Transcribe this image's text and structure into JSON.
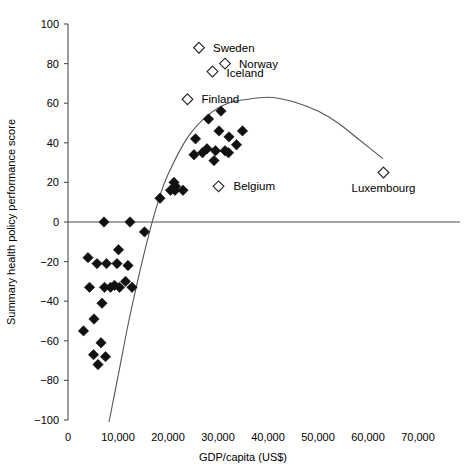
{
  "chart_data": {
    "type": "scatter",
    "title": "",
    "xlabel": "GDP/capita (US$)",
    "ylabel": "Summary health policy performance score",
    "xlim": [
      0,
      70000
    ],
    "ylim": [
      -100,
      100
    ],
    "xticks": [
      0,
      10000,
      20000,
      30000,
      40000,
      50000,
      60000,
      70000
    ],
    "xticklabels": [
      "0",
      "10,000",
      "20,000",
      "30,000",
      "40,000",
      "50,000",
      "60,000",
      "70,000"
    ],
    "yticks": [
      -100,
      -80,
      -60,
      -40,
      -20,
      0,
      20,
      40,
      60,
      80,
      100
    ],
    "yticklabels": [
      "-100",
      "-80",
      "-60",
      "-40",
      "-20",
      "0",
      "20",
      "40",
      "60",
      "80",
      "100"
    ],
    "grid": false,
    "legend": null,
    "zero_reference_line": 0,
    "marker_styles": {
      "unlabeled": "filled-diamond",
      "labeled": "open-diamond"
    },
    "labeled_points": [
      {
        "name": "Sweden",
        "x": 26200,
        "y": 88,
        "label_dx": 14,
        "label_dy": 4
      },
      {
        "name": "Norway",
        "x": 31400,
        "y": 80,
        "label_dx": 14,
        "label_dy": 4
      },
      {
        "name": "Iceland",
        "x": 28900,
        "y": 76,
        "label_dx": 14,
        "label_dy": 5
      },
      {
        "name": "Finland",
        "x": 23900,
        "y": 62,
        "label_dx": 14,
        "label_dy": 4
      },
      {
        "name": "Belgium",
        "x": 30100,
        "y": 18,
        "label_dx": 15,
        "label_dy": 4
      },
      {
        "name": "Luxembourg",
        "x": 63100,
        "y": 25,
        "label_dx": 0,
        "label_dy": 19
      }
    ],
    "unlabeled_points": [
      {
        "x": 12400,
        "y": 0
      },
      {
        "x": 15300,
        "y": -5
      },
      {
        "x": 18400,
        "y": 12
      },
      {
        "x": 20500,
        "y": 16
      },
      {
        "x": 21400,
        "y": 16
      },
      {
        "x": 21200,
        "y": 20
      },
      {
        "x": 21500,
        "y": 18
      },
      {
        "x": 23000,
        "y": 16
      },
      {
        "x": 25500,
        "y": 42
      },
      {
        "x": 25200,
        "y": 34
      },
      {
        "x": 28100,
        "y": 52
      },
      {
        "x": 30600,
        "y": 56
      },
      {
        "x": 30200,
        "y": 46
      },
      {
        "x": 29500,
        "y": 36
      },
      {
        "x": 29200,
        "y": 31
      },
      {
        "x": 32200,
        "y": 43
      },
      {
        "x": 32100,
        "y": 35
      },
      {
        "x": 31400,
        "y": 36
      },
      {
        "x": 33700,
        "y": 39
      },
      {
        "x": 34900,
        "y": 46
      },
      {
        "x": 26900,
        "y": 35
      },
      {
        "x": 27800,
        "y": 37
      },
      {
        "x": 7200,
        "y": 0
      },
      {
        "x": 10100,
        "y": -14
      },
      {
        "x": 4000,
        "y": -18
      },
      {
        "x": 5800,
        "y": -21
      },
      {
        "x": 7700,
        "y": -21
      },
      {
        "x": 9800,
        "y": -21
      },
      {
        "x": 12000,
        "y": -22
      },
      {
        "x": 11500,
        "y": -30
      },
      {
        "x": 12800,
        "y": -33
      },
      {
        "x": 9300,
        "y": -32
      },
      {
        "x": 4300,
        "y": -33
      },
      {
        "x": 7300,
        "y": -33
      },
      {
        "x": 8500,
        "y": -33
      },
      {
        "x": 10300,
        "y": -33
      },
      {
        "x": 6800,
        "y": -41
      },
      {
        "x": 5200,
        "y": -49
      },
      {
        "x": 3100,
        "y": -55
      },
      {
        "x": 6600,
        "y": -61
      },
      {
        "x": 5100,
        "y": -67
      },
      {
        "x": 7500,
        "y": -68
      },
      {
        "x": 6000,
        "y": -72
      }
    ],
    "fit_curve": {
      "description": "quadratic fit, peak near GDP 43,000 at score 62",
      "points": [
        {
          "x": 8200,
          "y": -101
        },
        {
          "x": 10000,
          "y": -78
        },
        {
          "x": 12000,
          "y": -52
        },
        {
          "x": 14000,
          "y": -29
        },
        {
          "x": 16000,
          "y": -8
        },
        {
          "x": 18000,
          "y": 10
        },
        {
          "x": 20000,
          "y": 24
        },
        {
          "x": 24000,
          "y": 43
        },
        {
          "x": 28000,
          "y": 54
        },
        {
          "x": 32000,
          "y": 60
        },
        {
          "x": 36000,
          "y": 62
        },
        {
          "x": 40000,
          "y": 63
        },
        {
          "x": 43000,
          "y": 62
        },
        {
          "x": 46000,
          "y": 60
        },
        {
          "x": 50000,
          "y": 56
        },
        {
          "x": 54000,
          "y": 50
        },
        {
          "x": 58000,
          "y": 42
        },
        {
          "x": 63000,
          "y": 32
        }
      ]
    }
  },
  "colors": {
    "marker_fill": "#111111",
    "marker_open_fill": "#ffffff",
    "marker_stroke": "#222222",
    "axis": "#4d4d4d",
    "curve": "#555555",
    "background": "#ffffff",
    "text": "#000000"
  }
}
